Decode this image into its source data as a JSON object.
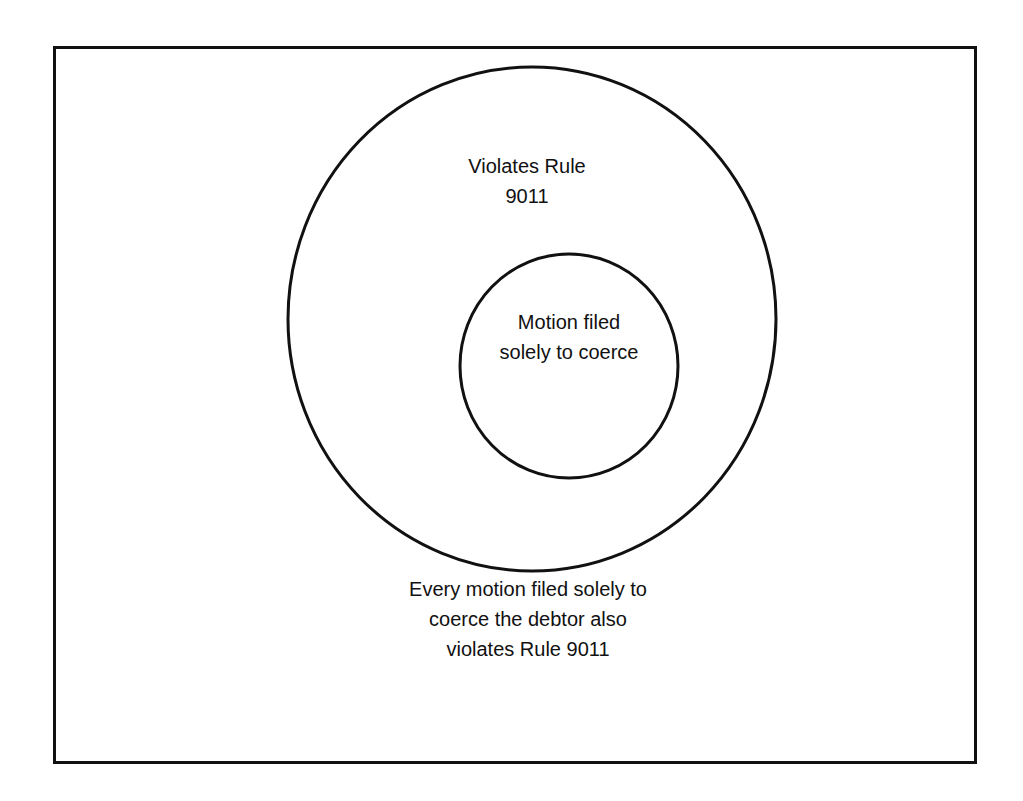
{
  "diagram": {
    "type": "nested-venn",
    "outer_set": {
      "label_lines": [
        "Violates Rule",
        "9011"
      ]
    },
    "inner_set": {
      "label_lines": [
        "Motion filed",
        "solely to coerce"
      ]
    },
    "caption_lines": [
      "Every motion filed solely to",
      "coerce the debtor also",
      "violates Rule 9011"
    ],
    "colors": {
      "stroke": "#111111",
      "background": "#ffffff"
    }
  }
}
